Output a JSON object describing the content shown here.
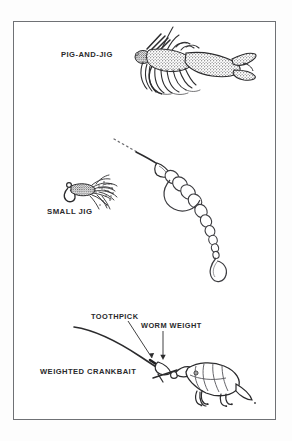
{
  "figure": {
    "type": "illustration-plate",
    "medium": "scanned line-art / stipple drawing",
    "background_color": "#ffffff",
    "ink_color": "#2a2a2c",
    "frame_color": "#6f7175"
  },
  "labels": {
    "pig_and_jig": "PIG-AND-JIG",
    "small_jig": "SMALL JIG",
    "toothpick": "TOOTHPICK",
    "worm_weight": "WORM WEIGHT",
    "weighted_crankbait": "WEIGHTED CRANKBAIT"
  },
  "illustrations": [
    {
      "name": "pig-and-jig",
      "label": "PIG-AND-JIG",
      "description": "Lead-head jig with brush guard, rubber skirt and pork-frog trailer with two claws",
      "parts": [
        "jig head",
        "weed guard",
        "skirt strands",
        "hook",
        "pork frog trailer"
      ]
    },
    {
      "name": "small-jig-with-worm",
      "label": "SMALL JIG",
      "description": "Small marabou jig shown beside a bullet-weighted plastic worm rigged on a line",
      "parts": [
        "jig head",
        "hook eye",
        "marabou skirt",
        "line",
        "bullet weight",
        "segmented plastic worm",
        "curl tail"
      ]
    },
    {
      "name": "weighted-crankbait",
      "label": "WEIGHTED CRANKBAIT",
      "description": "Crankbait on a line pegged with a toothpick through a worm weight",
      "parts": [
        "line",
        "toothpick",
        "worm weight",
        "crankbait body",
        "lip",
        "treble hooks"
      ]
    }
  ],
  "callouts": [
    {
      "label": "TOOTHPICK",
      "points_to": "toothpick wedged in worm weight"
    },
    {
      "label": "WORM WEIGHT",
      "points_to": "sliding bullet sinker ahead of crankbait"
    }
  ]
}
